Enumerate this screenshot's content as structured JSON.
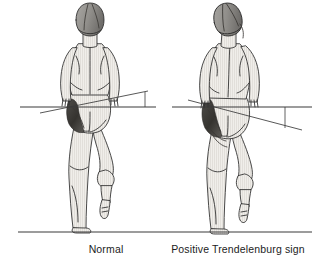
{
  "figure": {
    "type": "anatomical-line-illustration",
    "background_color": "#ffffff",
    "ink_color": "#1c1c1c",
    "skin_fill": "#eceae6",
    "skin_shadow": "#c9c6c0",
    "muscle_shadow": "#4a4845",
    "hair_fill": "#8e8c88",
    "line_color": "#2b2b2b"
  },
  "captions": {
    "left": "Normal",
    "right": "Positive Trendelenburg sign"
  },
  "reference_lines": {
    "horizontal_left": {
      "x1": 20,
      "y1": 107,
      "x2": 156,
      "y2": 107
    },
    "horizontal_right": {
      "x1": 172,
      "y1": 107,
      "x2": 312,
      "y2": 107
    },
    "ground": {
      "x1": 18,
      "y1": 232,
      "x2": 312,
      "y2": 232
    }
  },
  "pelvic_lines": {
    "left": {
      "x1": 40,
      "y1": 113,
      "x2": 148,
      "y2": 91,
      "tilt_direction": "slight-up-right"
    },
    "right": {
      "x1": 188,
      "y1": 100,
      "x2": 302,
      "y2": 130,
      "tilt_direction": "down-right"
    }
  },
  "angle_markers": {
    "left": {
      "x": 145,
      "y_top": 92,
      "y_bottom": 107,
      "size": "small",
      "meaning": "pelvis nearly level"
    },
    "right": {
      "x": 285,
      "y_top": 107,
      "y_bottom": 128,
      "size": "large",
      "meaning": "pelvis drops on swing side"
    }
  },
  "figures": [
    {
      "id": "normal",
      "side": "left",
      "center_x": 96,
      "posture": "upright trunk, level shoulders, level pelvis",
      "head_tilt_deg": 0,
      "stance_leg": "left",
      "lifted_leg": "right",
      "gluteal_shading": "present on stance-side hip"
    },
    {
      "id": "positive-trendelenburg",
      "side": "right",
      "center_x": 238,
      "posture": "trunk and head lean toward stance side, pelvis drops on opposite side",
      "head_tilt_deg": -12,
      "stance_leg": "left",
      "lifted_leg": "right",
      "gluteal_shading": "present on stance-side hip"
    }
  ]
}
